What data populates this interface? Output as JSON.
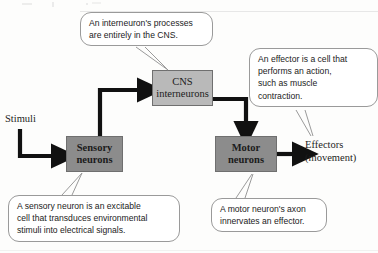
{
  "diagram": {
    "nodes": [
      {
        "id": "cns",
        "label": "CNS\ninterneurons",
        "line1": "CNS",
        "line2": "interneurons",
        "fill": "#b9b9b9"
      },
      {
        "id": "sensory",
        "label": "Sensory\nneurons",
        "line1": "Sensory",
        "line2": "neurons",
        "fill": "#8c8c8c"
      },
      {
        "id": "motor",
        "label": "Motor\nneurons",
        "line1": "Motor",
        "line2": "neurons",
        "fill": "#8c8c8c"
      }
    ],
    "labels": {
      "stimuli": "Stimuli",
      "effectors_line1": "Effectors",
      "effectors_line2": "(movement)"
    },
    "callouts": [
      {
        "id": "interneuron",
        "target": "cns",
        "line1": "An interneuron's processes",
        "line2": "are entirely in the CNS."
      },
      {
        "id": "effector",
        "target": "effectors",
        "line1": "An effector is a cell that",
        "line2": "performs an action,",
        "line3": "such as muscle",
        "line4": "contraction."
      },
      {
        "id": "sensory",
        "target": "sensory",
        "line1": "A sensory neuron is an excitable",
        "line2": "cell that transduces environmental",
        "line3": "stimuli into electrical signals."
      },
      {
        "id": "motor",
        "target": "motor",
        "line1": "A motor neuron's axon",
        "line2": "innervates an effector."
      }
    ],
    "arrows": [
      {
        "id": "stimuli-to-sensory",
        "from": "Stimuli",
        "to": "Sensory neurons"
      },
      {
        "id": "sensory-to-cns",
        "from": "Sensory neurons",
        "to": "CNS interneurons"
      },
      {
        "id": "cns-to-motor",
        "from": "CNS interneurons",
        "to": "Motor neurons"
      },
      {
        "id": "motor-to-effectors",
        "from": "Motor neurons",
        "to": "Effectors (movement)"
      }
    ],
    "colors": {
      "arrow": "#111111",
      "node_border": "#6f6f6f",
      "callout_border": "#9a9a9a",
      "text": "#1b1b1b"
    }
  }
}
